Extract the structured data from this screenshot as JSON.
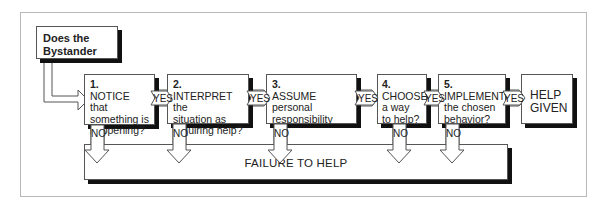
{
  "diagram": {
    "start": {
      "line1": "Does the",
      "line2": "Bystander"
    },
    "steps": [
      {
        "num": "1.",
        "line1": "NOTICE that",
        "line2": "something is",
        "line3": "happening?"
      },
      {
        "num": "2.",
        "line1": "INTERPRET the",
        "line2": "situation as",
        "line3": "requiring help?"
      },
      {
        "num": "3.",
        "line1": "ASSUME",
        "line2": "personal",
        "line3": "responsibility"
      },
      {
        "num": "4.",
        "line1": "CHOOSE",
        "line2": "a way",
        "line3": "to help?"
      },
      {
        "num": "5.",
        "line1": "IMPLEMENT",
        "line2": "the chosen",
        "line3": "behavior?"
      }
    ],
    "end": {
      "line1": "HELP",
      "line2": "GIVEN"
    },
    "yes_label": "YES",
    "no_label": "NO",
    "failure": "FAILURE TO HELP",
    "colors": {
      "border": "#555555",
      "shadow": "#111111",
      "frame": "#b8b8b8"
    }
  }
}
